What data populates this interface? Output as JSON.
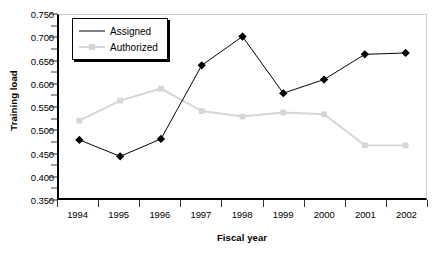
{
  "chart_data": {
    "type": "line",
    "title": "",
    "xlabel": "Fiscal year",
    "ylabel": "Training load",
    "categories": [
      "1994",
      "1995",
      "1996",
      "1997",
      "1998",
      "1999",
      "2000",
      "2001",
      "2002"
    ],
    "ylim": [
      0.35,
      0.75
    ],
    "ytick_step": 0.05,
    "ytick_labels": [
      "0.750",
      "0.700",
      "0.650",
      "0.600",
      "0.550",
      "0.500",
      "0.450",
      "0.400",
      "0.350"
    ],
    "ytick_values": [
      0.75,
      0.7,
      0.65,
      0.6,
      0.55,
      0.5,
      0.45,
      0.4,
      0.35
    ],
    "grid": false,
    "legend_position": "top-left",
    "series": [
      {
        "name": "Assigned",
        "color": "#000000",
        "marker": "diamond",
        "values": [
          0.477,
          0.441,
          0.479,
          0.64,
          0.703,
          0.579,
          0.609,
          0.664,
          0.667
        ]
      },
      {
        "name": "Authorized",
        "color": "#d6d6d6",
        "marker": "square",
        "values": [
          0.519,
          0.563,
          0.589,
          0.54,
          0.528,
          0.537,
          0.533,
          0.465,
          0.465
        ]
      }
    ]
  },
  "legend": {
    "items": [
      {
        "label": "Assigned"
      },
      {
        "label": "Authorized"
      }
    ]
  },
  "axes": {
    "y_title": "Training load",
    "x_title": "Fiscal year"
  }
}
